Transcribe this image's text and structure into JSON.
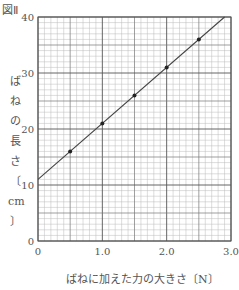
{
  "figure_label": "図Ⅱ",
  "chart_data": {
    "type": "scatter",
    "title": "",
    "xlabel": "ばねに加えた力の大きさ〔N〕",
    "ylabel": "ばねの長さ〔cm〕",
    "ylabel_chars": [
      "ば",
      "ね",
      "の",
      "長",
      "さ",
      "〔",
      "cm",
      "〕"
    ],
    "xlim": [
      0,
      3.0
    ],
    "ylim": [
      0,
      40
    ],
    "x_ticks": [
      0,
      1.0,
      2.0,
      3.0
    ],
    "x_tick_labels": [
      "0",
      "1.0",
      "2.0",
      "3.0"
    ],
    "y_ticks": [
      0,
      10,
      20,
      30,
      40
    ],
    "y_tick_labels": [
      "0",
      "10",
      "20",
      "30",
      "40"
    ],
    "grid": true,
    "grid_minor_x_step": 0.1,
    "grid_minor_y_step": 1,
    "points": {
      "x": [
        0.5,
        1.0,
        1.5,
        2.0,
        2.5
      ],
      "y": [
        16,
        21,
        26,
        31,
        36
      ]
    },
    "fit_line": {
      "slope": 10,
      "intercept": 11,
      "x_range": [
        0,
        2.9
      ]
    }
  }
}
